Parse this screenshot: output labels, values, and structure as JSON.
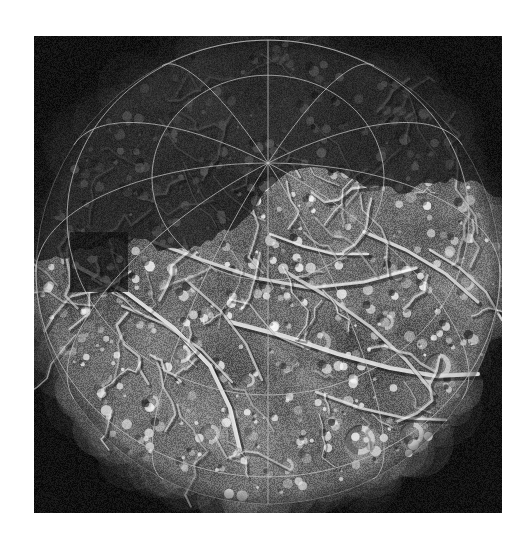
{
  "image": {
    "subject": "icy-moon-hemisphere",
    "body_name": "Ariel",
    "description": "Grayscale spacecraft mosaic of an icy satellite hemisphere with a white latitude-longitude graticule overlay on a black sky background",
    "view_type": "orthographic-globe-projection",
    "illumination": "terminator across upper portion of the disc; sunlit surface below",
    "alt_text": "Grayscale image of a cratered, fractured icy moon with overlaid coordinate grid"
  },
  "plate": {
    "x": 34,
    "y": 36,
    "width": 468,
    "height": 477,
    "background_color": "#050505",
    "border_color": "#ffffff"
  },
  "globe": {
    "center_x": 268,
    "center_y": 272,
    "radius_x": 232,
    "radius_y": 232,
    "tilt_degrees": 0,
    "north_pole_screen_x": 234,
    "north_pole_screen_y": 32,
    "south_pole_screen_x": 234,
    "south_pole_screen_y": 442
  },
  "graticule": {
    "color": "#c8c8c8",
    "opacity": 0.72,
    "line_width": 1.0,
    "latitude_step_degrees": 30,
    "longitude_step_degrees": 30,
    "latitude_lines": [
      -60,
      -30,
      0,
      30,
      60
    ],
    "longitude_lines": [
      0,
      30,
      60,
      90,
      120,
      150,
      180,
      210,
      240,
      270,
      300,
      330
    ],
    "pole_latitude": 90,
    "sub_observer_latitude": 62,
    "sub_observer_longitude": 0
  },
  "surface": {
    "base_gray": "#8e8e8e",
    "highlight_gray": "#f2f2f2",
    "shadow_gray": "#2a2a2a",
    "terminator_gray": "#101010",
    "data_gap_rect": {
      "x": 36,
      "y": 196,
      "width": 58,
      "height": 60
    },
    "feature_types": [
      "ridge",
      "graben",
      "fault-scarp",
      "impact-crater",
      "bright-ejecta-deposit",
      "chasma"
    ],
    "craters": [
      {
        "x": 148,
        "y": 318,
        "r": 9,
        "bright": 0.9
      },
      {
        "x": 214,
        "y": 344,
        "r": 7,
        "bright": 0.8
      },
      {
        "x": 286,
        "y": 306,
        "r": 11,
        "bright": 0.6
      },
      {
        "x": 352,
        "y": 286,
        "r": 8,
        "bright": 0.75
      },
      {
        "x": 404,
        "y": 330,
        "r": 13,
        "bright": 0.85
      },
      {
        "x": 326,
        "y": 404,
        "r": 15,
        "bright": 0.95
      },
      {
        "x": 252,
        "y": 430,
        "r": 8,
        "bright": 0.7
      },
      {
        "x": 176,
        "y": 398,
        "r": 10,
        "bright": 0.65
      },
      {
        "x": 432,
        "y": 246,
        "r": 9,
        "bright": 0.8
      },
      {
        "x": 118,
        "y": 366,
        "r": 7,
        "bright": 0.7
      },
      {
        "x": 378,
        "y": 398,
        "r": 12,
        "bright": 0.9
      },
      {
        "x": 206,
        "y": 268,
        "r": 6,
        "bright": 0.6
      }
    ],
    "ridges": [
      {
        "points": [
          [
            46,
            232
          ],
          [
            92,
            256
          ],
          [
            140,
            292
          ],
          [
            176,
            330
          ],
          [
            196,
            372
          ],
          [
            206,
            414
          ]
        ],
        "width": 5,
        "bright": 1.0
      },
      {
        "points": [
          [
            120,
            206
          ],
          [
            168,
            224
          ],
          [
            222,
            242
          ],
          [
            276,
            252
          ],
          [
            330,
            246
          ],
          [
            382,
            232
          ]
        ],
        "width": 4,
        "bright": 0.85
      },
      {
        "points": [
          [
            196,
            286
          ],
          [
            250,
            300
          ],
          [
            304,
            318
          ],
          [
            356,
            332
          ],
          [
            402,
            340
          ],
          [
            444,
            338
          ]
        ],
        "width": 5,
        "bright": 0.95
      },
      {
        "points": [
          [
            252,
            236
          ],
          [
            296,
            262
          ],
          [
            338,
            292
          ],
          [
            372,
            324
          ],
          [
            400,
            358
          ]
        ],
        "width": 4,
        "bright": 0.8
      },
      {
        "points": [
          [
            330,
            196
          ],
          [
            372,
            214
          ],
          [
            412,
            238
          ],
          [
            444,
            266
          ]
        ],
        "width": 4,
        "bright": 0.9
      },
      {
        "points": [
          [
            88,
            270
          ],
          [
            130,
            288
          ],
          [
            168,
            314
          ],
          [
            198,
            346
          ]
        ],
        "width": 3,
        "bright": 0.75
      },
      {
        "points": [
          [
            152,
            244
          ],
          [
            186,
            274
          ],
          [
            212,
            308
          ],
          [
            228,
            344
          ]
        ],
        "width": 3,
        "bright": 0.7
      },
      {
        "points": [
          [
            282,
            356
          ],
          [
            326,
            372
          ],
          [
            370,
            382
          ],
          [
            412,
            384
          ]
        ],
        "width": 3,
        "bright": 0.8
      },
      {
        "points": [
          [
            396,
            214
          ],
          [
            426,
            232
          ],
          [
            452,
            256
          ],
          [
            468,
            284
          ]
        ],
        "width": 3,
        "bright": 0.85
      },
      {
        "points": [
          [
            236,
            198
          ],
          [
            268,
            210
          ],
          [
            300,
            218
          ],
          [
            334,
            218
          ]
        ],
        "width": 3,
        "bright": 0.9
      }
    ]
  },
  "palette": {
    "page_background": "#ffffff",
    "sky": "#050505",
    "grid": "#c8c8c8",
    "surface_mid": "#8e8e8e"
  }
}
